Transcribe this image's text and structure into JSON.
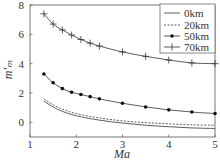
{
  "chart_data": {
    "type": "line",
    "title": "",
    "xlabel": "Ma",
    "ylabel": "m′ₘ",
    "xlim": [
      1,
      5
    ],
    "ylim": [
      -1,
      8
    ],
    "xticks": [
      1,
      2,
      3,
      4,
      5
    ],
    "yticks": [
      0,
      2,
      4,
      6,
      8
    ],
    "grid": false,
    "legend_position": "upper right",
    "series": [
      {
        "name": "0km",
        "style": "solid",
        "marker": "none",
        "x": [
          1.3,
          1.5,
          1.7,
          2.0,
          2.5,
          3.0,
          3.5,
          4.0,
          4.5,
          5.0
        ],
        "y": [
          1.45,
          1.05,
          0.75,
          0.45,
          0.15,
          -0.05,
          -0.2,
          -0.3,
          -0.38,
          -0.42
        ]
      },
      {
        "name": "20km",
        "style": "dashed",
        "marker": "none",
        "x": [
          1.3,
          1.5,
          1.7,
          2.0,
          2.5,
          3.0,
          3.5,
          4.0,
          4.5,
          5.0
        ],
        "y": [
          1.6,
          1.2,
          0.9,
          0.6,
          0.3,
          0.1,
          -0.02,
          -0.1,
          -0.17,
          -0.2
        ]
      },
      {
        "name": "50km",
        "style": "solid",
        "marker": "circle",
        "x": [
          1.3,
          1.5,
          1.7,
          1.9,
          2.1,
          2.3,
          2.5,
          3.0,
          3.5,
          4.0,
          4.5,
          5.0
        ],
        "y": [
          3.3,
          2.7,
          2.3,
          2.05,
          1.9,
          1.75,
          1.6,
          1.3,
          1.05,
          0.85,
          0.7,
          0.6
        ]
      },
      {
        "name": "70km",
        "style": "solid",
        "marker": "plus",
        "x": [
          1.3,
          1.5,
          1.7,
          1.9,
          2.1,
          2.3,
          2.5,
          3.0,
          3.5,
          4.0,
          4.5,
          5.0
        ],
        "y": [
          7.4,
          6.7,
          6.3,
          5.95,
          5.65,
          5.4,
          5.2,
          4.8,
          4.5,
          4.25,
          4.05,
          4.0
        ]
      }
    ]
  },
  "legend": {
    "items": [
      {
        "label": "0km"
      },
      {
        "label": "20km"
      },
      {
        "label": "50km"
      },
      {
        "label": "70km"
      }
    ]
  },
  "axes": {
    "xlabel": "Ma",
    "ylabel": "m′ₘ",
    "xtick_labels": [
      "1",
      "2",
      "3",
      "4",
      "5"
    ],
    "ytick_labels": [
      "0",
      "2",
      "4",
      "6",
      "8"
    ]
  }
}
